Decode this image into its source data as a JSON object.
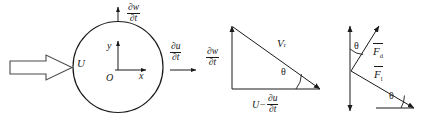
{
  "figure": {
    "background_color": "#ffffff",
    "stroke_color": "#1a1a1a",
    "width": 422,
    "height": 120
  },
  "panel_left": {
    "name": "cylinder-cross-section",
    "inflow_label": "U",
    "top_label": {
      "numerator": "∂w",
      "denominator": "∂t"
    },
    "right_label": {
      "numerator": "∂u",
      "denominator": "∂t"
    },
    "origin_label": "O",
    "axis_y_label": "y",
    "axis_x_label": "x"
  },
  "panel_middle": {
    "name": "velocity-triangle",
    "vertical_label": {
      "numerator": "∂w",
      "denominator": "∂t"
    },
    "hypotenuse_label": "V",
    "hypotenuse_subscript": "r",
    "angle_label": "θ",
    "base_label_lead": "U−",
    "base_label_fraction": {
      "numerator": "∂u",
      "denominator": "∂t"
    }
  },
  "panel_right": {
    "name": "force-decomposition",
    "force_upper_symbol": "F",
    "force_upper_subscript": "d",
    "force_lower_symbol": "F",
    "force_lower_subscript": "l",
    "angle_upper_label": "θ",
    "angle_lower_label": "θ"
  }
}
